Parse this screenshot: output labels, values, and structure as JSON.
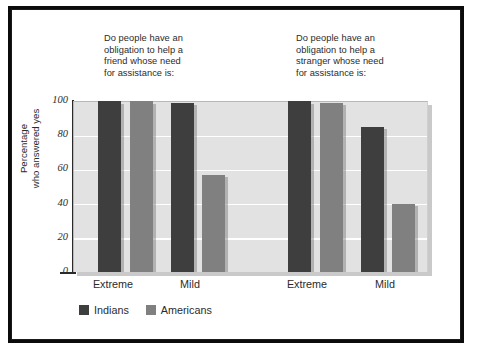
{
  "figure": {
    "captions": [
      {
        "id": "friend",
        "text": "Do people have an\nobligation to help a\nfriend whose need\nfor assistance is:"
      },
      {
        "id": "stranger",
        "text": "Do people have an\nobligation to help a\nstranger whose need\nfor assistance is:"
      }
    ]
  },
  "chart_data": {
    "type": "bar",
    "title": "",
    "panels": [
      {
        "caption": "Do people have an obligation to help a friend whose need for assistance is:",
        "categories": [
          "Extreme",
          "Mild"
        ],
        "series": [
          {
            "name": "Indians",
            "values": [
              100,
              99
            ]
          },
          {
            "name": "Americans",
            "values": [
              100,
              57
            ]
          }
        ]
      },
      {
        "caption": "Do people have an obligation to help a stranger whose need for assistance is:",
        "categories": [
          "Extreme",
          "Mild"
        ],
        "series": [
          {
            "name": "Indians",
            "values": [
              100,
              85
            ]
          },
          {
            "name": "Americans",
            "values": [
              99,
              40
            ]
          }
        ]
      }
    ],
    "categories": [
      "Extreme",
      "Mild",
      "Extreme",
      "Mild"
    ],
    "series": [
      {
        "name": "Indians",
        "values": [
          100,
          99,
          100,
          85
        ],
        "color": "#3e3e3e"
      },
      {
        "name": "Americans",
        "values": [
          100,
          57,
          99,
          40
        ],
        "color": "#808080"
      }
    ],
    "xlabel": "",
    "ylabel": "Percentage\nwho answered yes",
    "ylim": [
      0,
      100
    ],
    "yticks": [
      0,
      20,
      40,
      60,
      80,
      100
    ],
    "ytick_labels": [
      "0",
      "20",
      "40",
      "60",
      "80",
      "100"
    ],
    "grid": "horizontal",
    "legend_position": "bottom-left",
    "legend": [
      "Indians",
      "Americans"
    ],
    "plot_background": "#e2e2e2",
    "gridline_color": "#ffffff"
  },
  "axis": {
    "y_title_line1": "Percentage",
    "y_title_line2": "who answered yes",
    "y_title": "Percentage\nwho answered yes",
    "tick_100": "100",
    "tick_80": "80",
    "tick_60": "60",
    "tick_40": "40",
    "tick_20": "20",
    "tick_0": "0"
  },
  "xlabels": [
    {
      "text": "Extreme"
    },
    {
      "text": "Mild"
    },
    {
      "text": "Extreme"
    },
    {
      "text": "Mild"
    }
  ],
  "legend": {
    "items": [
      {
        "label": "Indians",
        "color": "#3e3e3e"
      },
      {
        "label": "Americans",
        "color": "#808080"
      }
    ]
  }
}
